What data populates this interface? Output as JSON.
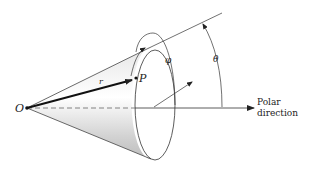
{
  "figure": {
    "type": "spherical-coordinates-cone-diagram",
    "labels": {
      "origin": "O",
      "point": "P",
      "radius": "r",
      "azimuth": "φ",
      "polar_angle": "θ",
      "axis_line1": "Polar",
      "axis_line2": "direction"
    },
    "colors": {
      "line": "#333333",
      "cone_shade": "#c8c8c8",
      "background": "#ffffff"
    }
  }
}
